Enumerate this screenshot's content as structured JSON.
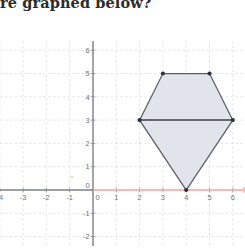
{
  "question": {
    "text": "re graphed below?"
  },
  "chart_data": {
    "type": "scatter",
    "title": "",
    "xlabel": "",
    "ylabel": "",
    "xlim": [
      -4.6,
      6.6
    ],
    "ylim": [
      -2.4,
      6.4
    ],
    "grid": true,
    "legend": null,
    "x_ticks": [
      -4,
      -3,
      -2,
      -1,
      0,
      1,
      2,
      3,
      4,
      5,
      6
    ],
    "x_tick_labels": [
      "-4",
      "-3",
      "-2",
      "-1",
      "0",
      "1",
      "2",
      "3",
      "4",
      "5",
      "6"
    ],
    "y_ticks": [
      -2,
      -1,
      0,
      1,
      2,
      3,
      4,
      5,
      6
    ],
    "y_tick_labels": [
      "-2",
      "-1",
      "0",
      "1",
      "2",
      "3",
      "4",
      "5",
      "6"
    ],
    "shapes": [
      {
        "name": "kite-polygon",
        "type": "polygon",
        "fill": "#dfe4ea",
        "stroke": "#5a5f66",
        "vertices": [
          {
            "x": 3,
            "y": 5
          },
          {
            "x": 5,
            "y": 5
          },
          {
            "x": 6,
            "y": 3
          },
          {
            "x": 4,
            "y": 0
          },
          {
            "x": 2,
            "y": 3
          }
        ]
      },
      {
        "name": "horizontal-chord",
        "type": "segment",
        "stroke": "#3b3f45",
        "from": {
          "x": 2,
          "y": 3
        },
        "to": {
          "x": 6,
          "y": 3
        }
      }
    ],
    "points": [
      {
        "x": 3,
        "y": 5
      },
      {
        "x": 5,
        "y": 5
      },
      {
        "x": 6,
        "y": 3
      },
      {
        "x": 4,
        "y": 0
      },
      {
        "x": 2,
        "y": 3
      }
    ],
    "axis_highlight": {
      "name": "x-axis-positive-ray",
      "color": "#f2a3a3",
      "from": {
        "x": 0,
        "y": 0
      },
      "to": {
        "x": 6.6,
        "y": 0
      }
    }
  },
  "colors": {
    "grid": "#d9dde4",
    "axis": "#7c7f85",
    "axis_highlight": "#f2a3a3",
    "shape_fill": "#dfe4ea",
    "shape_stroke": "#5a5f66",
    "vertex": "#2e3237",
    "tick_text": "#6e747c",
    "question_text": "#2b2b2b"
  }
}
